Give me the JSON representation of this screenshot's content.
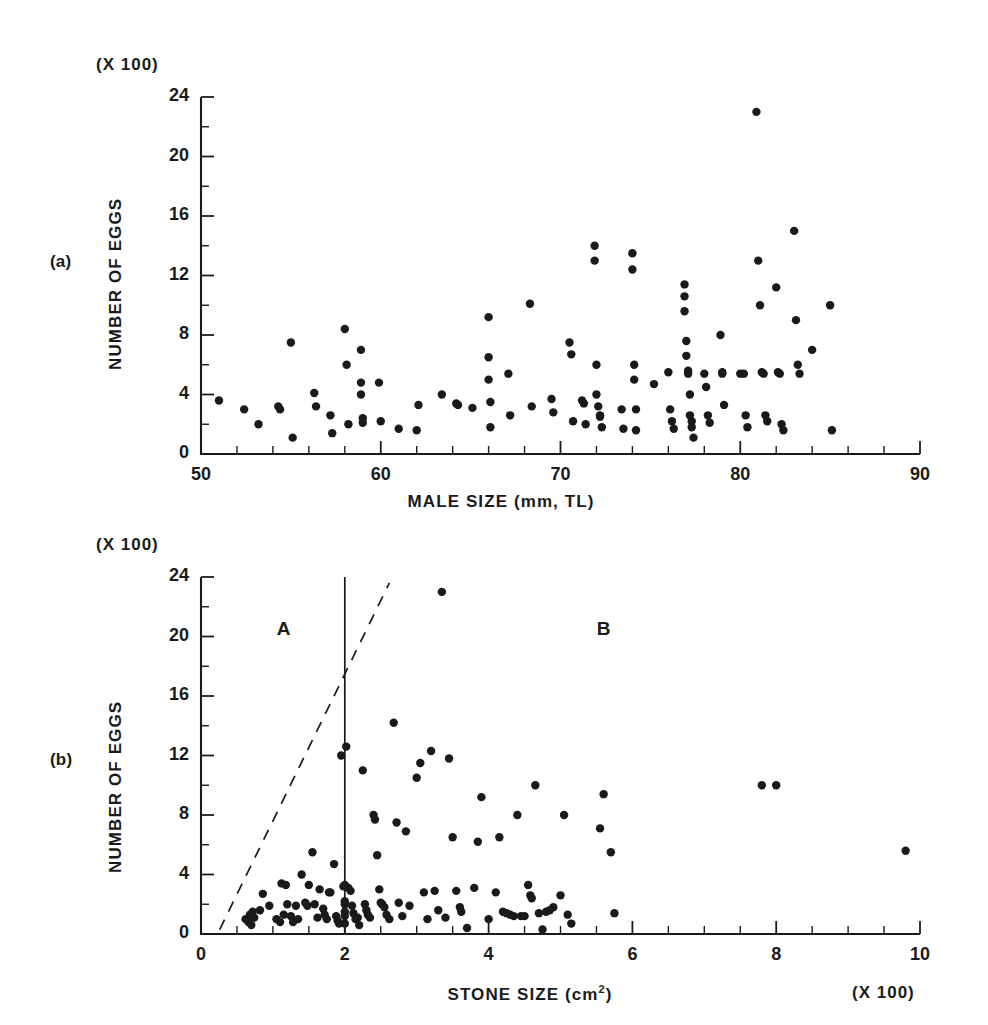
{
  "figure": {
    "panels": [
      {
        "id": "a",
        "panel_label": "(a)",
        "y_multiplier": "(X 100)",
        "x_multiplier": ""
      },
      {
        "id": "b",
        "panel_label": "(b)",
        "y_multiplier": "(X 100)",
        "x_multiplier": "(X 100)"
      }
    ]
  },
  "chart_data": [
    {
      "type": "scatter",
      "panel": "a",
      "title": "",
      "xlabel": "MALE SIZE (mm, TL)",
      "ylabel": "NUMBER OF EGGS",
      "y_multiplier_label": "(X 100)",
      "xlim": [
        50,
        90
      ],
      "ylim": [
        0,
        24
      ],
      "xticks": [
        50,
        60,
        70,
        80,
        90
      ],
      "xtick_labels": [
        "50",
        "60",
        "70",
        "80",
        "90"
      ],
      "x_minor_tick_step": 2,
      "yticks": [
        0,
        4,
        8,
        12,
        16,
        20,
        24
      ],
      "ytick_labels": [
        "0",
        "4",
        "8",
        "12",
        "16",
        "20",
        "24"
      ],
      "y_minor_tick_step": 2,
      "grid": false,
      "legend": false,
      "points": [
        [
          51.0,
          3.6
        ],
        [
          52.4,
          3.0
        ],
        [
          53.2,
          2.0
        ],
        [
          54.3,
          3.2
        ],
        [
          54.4,
          3.0
        ],
        [
          55.0,
          7.5
        ],
        [
          55.1,
          1.1
        ],
        [
          56.3,
          4.1
        ],
        [
          56.4,
          3.2
        ],
        [
          57.2,
          2.6
        ],
        [
          57.3,
          1.4
        ],
        [
          58.0,
          8.4
        ],
        [
          58.1,
          6.0
        ],
        [
          58.2,
          2.0
        ],
        [
          58.9,
          7.0
        ],
        [
          58.9,
          4.8
        ],
        [
          58.9,
          4.0
        ],
        [
          59.0,
          2.4
        ],
        [
          59.0,
          2.1
        ],
        [
          59.9,
          4.8
        ],
        [
          60.0,
          2.2
        ],
        [
          61.0,
          1.7
        ],
        [
          62.0,
          1.6
        ],
        [
          62.1,
          3.3
        ],
        [
          63.4,
          4.0
        ],
        [
          64.2,
          3.4
        ],
        [
          64.3,
          3.3
        ],
        [
          65.1,
          3.1
        ],
        [
          66.0,
          9.2
        ],
        [
          66.0,
          6.5
        ],
        [
          66.0,
          5.0
        ],
        [
          66.1,
          3.5
        ],
        [
          66.1,
          1.8
        ],
        [
          67.1,
          5.4
        ],
        [
          67.2,
          2.6
        ],
        [
          68.3,
          10.1
        ],
        [
          68.4,
          3.2
        ],
        [
          69.5,
          3.7
        ],
        [
          69.6,
          2.8
        ],
        [
          70.5,
          7.5
        ],
        [
          70.6,
          6.7
        ],
        [
          70.7,
          2.2
        ],
        [
          71.2,
          3.6
        ],
        [
          71.3,
          3.4
        ],
        [
          71.4,
          2.0
        ],
        [
          71.9,
          14.0
        ],
        [
          71.9,
          13.0
        ],
        [
          72.0,
          6.0
        ],
        [
          72.0,
          4.0
        ],
        [
          72.1,
          3.2
        ],
        [
          72.2,
          2.6
        ],
        [
          72.2,
          2.5
        ],
        [
          72.3,
          1.8
        ],
        [
          73.4,
          3.0
        ],
        [
          73.5,
          1.7
        ],
        [
          74.0,
          13.5
        ],
        [
          74.0,
          12.4
        ],
        [
          74.1,
          6.0
        ],
        [
          74.1,
          5.0
        ],
        [
          74.2,
          3.0
        ],
        [
          74.2,
          1.6
        ],
        [
          75.2,
          4.7
        ],
        [
          76.0,
          5.5
        ],
        [
          76.1,
          3.0
        ],
        [
          76.2,
          2.2
        ],
        [
          76.3,
          1.7
        ],
        [
          76.9,
          11.4
        ],
        [
          76.9,
          10.6
        ],
        [
          76.9,
          9.6
        ],
        [
          77.0,
          7.6
        ],
        [
          77.0,
          6.6
        ],
        [
          77.1,
          5.6
        ],
        [
          77.1,
          5.4
        ],
        [
          77.2,
          4.0
        ],
        [
          77.2,
          2.6
        ],
        [
          77.3,
          2.2
        ],
        [
          77.3,
          1.8
        ],
        [
          77.4,
          1.1
        ],
        [
          78.0,
          5.4
        ],
        [
          78.1,
          4.5
        ],
        [
          78.2,
          2.6
        ],
        [
          78.3,
          2.1
        ],
        [
          78.9,
          8.0
        ],
        [
          79.0,
          5.5
        ],
        [
          79.0,
          5.4
        ],
        [
          79.1,
          3.3
        ],
        [
          80.0,
          5.4
        ],
        [
          80.2,
          5.4
        ],
        [
          80.3,
          2.6
        ],
        [
          80.4,
          1.8
        ],
        [
          80.9,
          23.0
        ],
        [
          81.0,
          13.0
        ],
        [
          81.1,
          10.0
        ],
        [
          81.2,
          5.5
        ],
        [
          81.3,
          5.4
        ],
        [
          81.4,
          2.6
        ],
        [
          81.5,
          2.2
        ],
        [
          82.0,
          11.2
        ],
        [
          82.1,
          5.5
        ],
        [
          82.2,
          5.4
        ],
        [
          82.3,
          2.0
        ],
        [
          82.4,
          1.6
        ],
        [
          83.0,
          15.0
        ],
        [
          83.1,
          9.0
        ],
        [
          83.2,
          6.0
        ],
        [
          83.3,
          5.4
        ],
        [
          84.0,
          7.0
        ],
        [
          85.0,
          10.0
        ],
        [
          85.1,
          1.6
        ]
      ]
    },
    {
      "type": "scatter",
      "panel": "b",
      "title": "",
      "xlabel": "STONE SIZE (cm2)",
      "xlabel_base": "STONE SIZE (cm",
      "xlabel_exponent": "2",
      "xlabel_tail": ")",
      "ylabel": "NUMBER OF EGGS",
      "y_multiplier_label": "(X 100)",
      "x_multiplier_label": "(X 100)",
      "xlim": [
        0,
        10
      ],
      "ylim": [
        0,
        24
      ],
      "xticks": [
        0,
        2,
        4,
        6,
        8,
        10
      ],
      "xtick_labels": [
        "0",
        "2",
        "4",
        "6",
        "8",
        "10"
      ],
      "x_minor_tick_step": 0.5,
      "yticks": [
        0,
        4,
        8,
        12,
        16,
        20,
        24
      ],
      "ytick_labels": [
        "0",
        "4",
        "8",
        "12",
        "16",
        "20",
        "24"
      ],
      "y_minor_tick_step": 2,
      "grid": false,
      "legend": false,
      "annotations": [
        {
          "kind": "region-label",
          "text": "A",
          "x": 1.15,
          "y": 20.4
        },
        {
          "kind": "region-label",
          "text": "B",
          "x": 5.6,
          "y": 20.4
        }
      ],
      "reference_lines": [
        {
          "kind": "vertical-solid",
          "x": 2.0,
          "y_from": 0,
          "y_to": 24
        },
        {
          "kind": "diagonal-dashed",
          "x_from": 0.26,
          "y_from": 0.3,
          "x_to": 2.62,
          "y_to": 23.6
        }
      ],
      "points": [
        [
          0.62,
          1.0
        ],
        [
          0.66,
          0.8
        ],
        [
          0.68,
          1.3
        ],
        [
          0.7,
          0.6
        ],
        [
          0.72,
          1.5
        ],
        [
          0.74,
          1.1
        ],
        [
          0.82,
          1.6
        ],
        [
          0.86,
          2.7
        ],
        [
          0.95,
          1.9
        ],
        [
          1.05,
          1.0
        ],
        [
          1.1,
          0.8
        ],
        [
          1.12,
          3.4
        ],
        [
          1.15,
          1.3
        ],
        [
          1.18,
          3.3
        ],
        [
          1.2,
          2.0
        ],
        [
          1.25,
          1.2
        ],
        [
          1.28,
          0.8
        ],
        [
          1.32,
          1.9
        ],
        [
          1.35,
          1.0
        ],
        [
          1.4,
          4.0
        ],
        [
          1.45,
          2.1
        ],
        [
          1.48,
          1.9
        ],
        [
          1.5,
          3.3
        ],
        [
          1.55,
          5.5
        ],
        [
          1.58,
          2.0
        ],
        [
          1.62,
          1.1
        ],
        [
          1.65,
          3.0
        ],
        [
          1.7,
          1.7
        ],
        [
          1.72,
          1.3
        ],
        [
          1.75,
          1.0
        ],
        [
          1.78,
          2.8
        ],
        [
          1.8,
          2.8
        ],
        [
          1.85,
          4.7
        ],
        [
          1.88,
          1.2
        ],
        [
          1.9,
          0.9
        ],
        [
          1.92,
          0.7
        ],
        [
          1.95,
          12.0
        ],
        [
          1.98,
          3.2
        ],
        [
          2.0,
          3.3
        ],
        [
          2.0,
          2.2
        ],
        [
          2.0,
          2.0
        ],
        [
          2.0,
          1.5
        ],
        [
          2.0,
          1.2
        ],
        [
          2.0,
          0.7
        ],
        [
          2.02,
          12.6
        ],
        [
          2.05,
          3.1
        ],
        [
          2.08,
          2.9
        ],
        [
          2.1,
          1.9
        ],
        [
          2.12,
          1.4
        ],
        [
          2.15,
          1.0
        ],
        [
          2.18,
          1.1
        ],
        [
          2.2,
          0.6
        ],
        [
          2.25,
          11.0
        ],
        [
          2.28,
          2.0
        ],
        [
          2.3,
          1.6
        ],
        [
          2.32,
          1.3
        ],
        [
          2.35,
          1.1
        ],
        [
          2.4,
          8.0
        ],
        [
          2.42,
          7.7
        ],
        [
          2.45,
          5.3
        ],
        [
          2.48,
          3.0
        ],
        [
          2.5,
          2.1
        ],
        [
          2.52,
          2.0
        ],
        [
          2.55,
          1.8
        ],
        [
          2.58,
          1.3
        ],
        [
          2.62,
          1.0
        ],
        [
          2.68,
          14.2
        ],
        [
          2.72,
          7.5
        ],
        [
          2.75,
          2.1
        ],
        [
          2.8,
          1.2
        ],
        [
          2.85,
          6.9
        ],
        [
          2.9,
          1.9
        ],
        [
          3.0,
          10.5
        ],
        [
          3.05,
          11.5
        ],
        [
          3.1,
          2.8
        ],
        [
          3.15,
          1.0
        ],
        [
          3.2,
          12.3
        ],
        [
          3.25,
          2.9
        ],
        [
          3.3,
          1.6
        ],
        [
          3.35,
          23.0
        ],
        [
          3.4,
          1.1
        ],
        [
          3.45,
          11.8
        ],
        [
          3.5,
          6.5
        ],
        [
          3.55,
          2.9
        ],
        [
          3.6,
          1.8
        ],
        [
          3.62,
          1.5
        ],
        [
          3.7,
          0.4
        ],
        [
          3.8,
          3.1
        ],
        [
          3.85,
          6.2
        ],
        [
          3.9,
          9.2
        ],
        [
          4.0,
          1.0
        ],
        [
          4.1,
          2.8
        ],
        [
          4.15,
          6.5
        ],
        [
          4.2,
          1.5
        ],
        [
          4.25,
          1.4
        ],
        [
          4.3,
          1.3
        ],
        [
          4.35,
          1.2
        ],
        [
          4.4,
          8.0
        ],
        [
          4.45,
          1.2
        ],
        [
          4.5,
          1.2
        ],
        [
          4.55,
          3.3
        ],
        [
          4.58,
          2.6
        ],
        [
          4.6,
          2.4
        ],
        [
          4.65,
          10.0
        ],
        [
          4.7,
          1.4
        ],
        [
          4.75,
          0.3
        ],
        [
          4.8,
          1.5
        ],
        [
          4.85,
          1.6
        ],
        [
          4.9,
          1.8
        ],
        [
          5.0,
          2.6
        ],
        [
          5.05,
          8.0
        ],
        [
          5.1,
          1.3
        ],
        [
          5.15,
          0.7
        ],
        [
          5.55,
          7.1
        ],
        [
          5.6,
          9.4
        ],
        [
          5.7,
          5.5
        ],
        [
          5.75,
          1.4
        ],
        [
          7.8,
          10.0
        ],
        [
          8.0,
          10.0
        ],
        [
          9.8,
          5.6
        ]
      ]
    }
  ]
}
